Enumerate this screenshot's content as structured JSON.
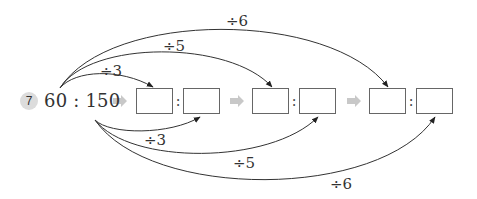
{
  "problem": {
    "number": "7",
    "ratio_text": "60 : 150",
    "colon": ":",
    "pairs": [
      {
        "index": 1,
        "left_value": "",
        "right_value": ""
      },
      {
        "index": 2,
        "left_value": "",
        "right_value": ""
      },
      {
        "index": 3,
        "left_value": "",
        "right_value": ""
      }
    ],
    "top_labels": [
      "÷3",
      "÷5",
      "÷6"
    ],
    "bottom_labels": [
      "÷3",
      "÷5",
      "÷6"
    ]
  },
  "colors": {
    "badge": "#dcdcdc",
    "arrow_fill": "#c8c8c8",
    "line": "#333333",
    "box_border": "#666666"
  }
}
